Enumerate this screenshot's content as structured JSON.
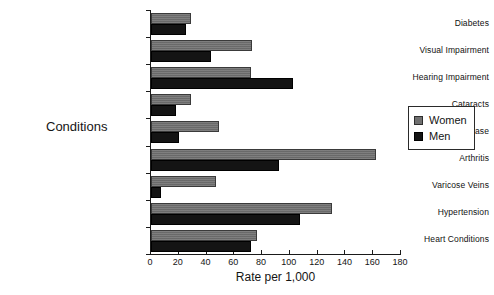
{
  "chart_data": {
    "type": "bar",
    "orientation": "horizontal",
    "title": "",
    "xlabel": "Rate per 1,000",
    "ylabel": "Conditions",
    "xlim": [
      0,
      180
    ],
    "xticks": [
      0,
      20,
      40,
      60,
      80,
      100,
      120,
      140,
      160,
      180
    ],
    "grid": false,
    "legend_position": "right",
    "categories": [
      "Diabetes",
      "Visual Impairment",
      "Hearing Impairment",
      "Cataracts",
      "Urinary Disease",
      "Arthritis",
      "Varicose Veins",
      "Hypertension",
      "Heart Conditions"
    ],
    "series": [
      {
        "name": "Women",
        "color": "#707070",
        "values": [
          29,
          73,
          72,
          29,
          49,
          162,
          47,
          130,
          76
        ]
      },
      {
        "name": "Men",
        "color": "#141414",
        "values": [
          25,
          43,
          102,
          18,
          20,
          92,
          7,
          107,
          72
        ]
      }
    ]
  },
  "legend": {
    "items": [
      {
        "label": "Women",
        "swatch": "women"
      },
      {
        "label": "Men",
        "swatch": "men"
      }
    ]
  }
}
